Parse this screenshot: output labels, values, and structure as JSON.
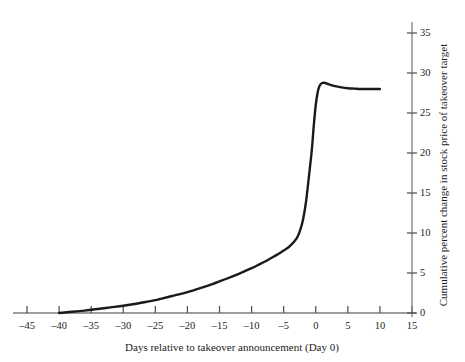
{
  "chart_data": {
    "type": "line",
    "title": "",
    "subtitle": "",
    "xlabel": "Days relative to takeover announcement (Day 0)",
    "ylabel": "Cumulative percent change in stock price of takeover target",
    "xlim": [
      -45,
      15
    ],
    "ylim": [
      0,
      35
    ],
    "xticks": [
      -45,
      -40,
      -35,
      -30,
      -25,
      -20,
      -15,
      -10,
      -5,
      0,
      5,
      10,
      15
    ],
    "yticks": [
      0,
      5,
      10,
      15,
      20,
      25,
      30,
      35
    ],
    "xtick_labels": [
      "–45",
      "–40",
      "–35",
      "–30",
      "–25",
      "–20",
      "–15",
      "–10",
      "–5",
      "0",
      "5",
      "10",
      "15"
    ],
    "ytick_labels": [
      "0",
      "5",
      "10",
      "15",
      "20",
      "25",
      "30",
      "35"
    ],
    "grid": false,
    "legend": null,
    "legend_position": "none",
    "y_axis_side": "right",
    "x_axis_position": "bottom",
    "series": [
      {
        "name": "Cumulative abnormal return of takeover target",
        "color": "#1a1a1a",
        "line_width": 2.4,
        "x": [
          -40,
          -38,
          -36,
          -35,
          -34,
          -32,
          -30,
          -28,
          -26,
          -25,
          -24,
          -22,
          -20,
          -18,
          -16,
          -15,
          -14,
          -12,
          -10,
          -9,
          -8,
          -7,
          -6,
          -5,
          -4,
          -3,
          -2.5,
          -2,
          -1.5,
          -1,
          -0.6,
          -0.3,
          0,
          0.3,
          0.6,
          1,
          1.5,
          2,
          3,
          4,
          5,
          6,
          7,
          8,
          9,
          10
        ],
        "y": [
          0.0,
          0.15,
          0.3,
          0.4,
          0.5,
          0.7,
          0.9,
          1.15,
          1.45,
          1.6,
          1.8,
          2.2,
          2.6,
          3.1,
          3.65,
          3.95,
          4.25,
          4.9,
          5.6,
          6.0,
          6.4,
          6.85,
          7.3,
          7.8,
          8.4,
          9.3,
          10.2,
          11.6,
          14.0,
          17.5,
          20.5,
          23.5,
          26.0,
          27.6,
          28.4,
          28.75,
          28.75,
          28.6,
          28.35,
          28.2,
          28.1,
          28.05,
          28.0,
          28.0,
          28.0,
          28.0
        ]
      }
    ],
    "annotations": []
  },
  "axes": {
    "x_axis_name": "days-relative-axis",
    "y_axis_name": "cumulative-percent-change-axis"
  }
}
